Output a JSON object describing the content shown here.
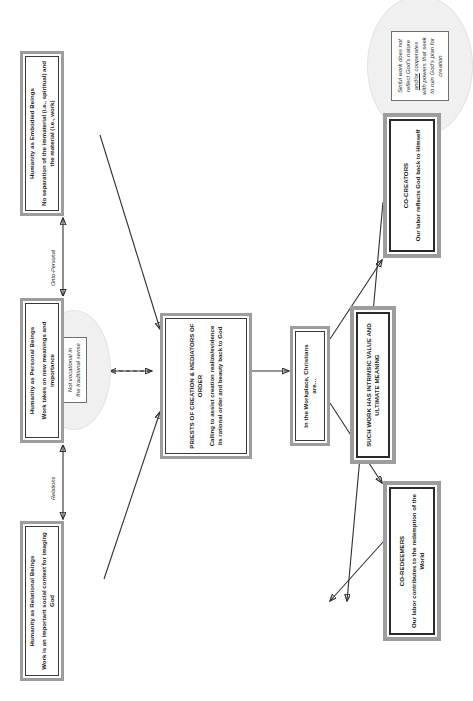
{
  "diagram": {
    "orientation": "rotated-90",
    "colors": {
      "node_outer_border": "#9d9d9d",
      "node_inner_border": "#3a3a3a",
      "callout_fill": "#f0f0f0",
      "edge": "#2f2f2f",
      "background": "#ffffff"
    }
  },
  "nodes": {
    "relational": {
      "title": "Humanity as Relational Beings",
      "body": "Work is an important social context for imaging God"
    },
    "personal": {
      "title": "Humanity as Personal Beings",
      "body": "Work takes on new meanings and importance"
    },
    "embodied": {
      "title": "Humanity as Embodied Beings",
      "body": "No separation of the immaterial (i.e., spiritual) and the material (i.e., work)"
    },
    "priests": {
      "title": "PRIESTS OF CREATION & MEDIATORS OF ORDER",
      "body": "Calling to assist creation realize/evidence its rational order and beauty back to God"
    },
    "workplace": {
      "title": "In the Workplace, Christians are…",
      "body": ""
    },
    "coredeemers": {
      "title": "CO-REDEEMERS",
      "body": "Our labor contributes to the redemption of the World"
    },
    "cocreators": {
      "title": "CO-CREATORS",
      "body": "Our labor reflects God back to Himself"
    },
    "conclusion": {
      "title": "SUCH WORK HAS INTRINSIC VALUE AND ULTIMATE MEANING",
      "body": ""
    }
  },
  "callouts": {
    "top": {
      "line1": "Not vocational in",
      "line2": "the traditional sense"
    },
    "bottom": {
      "line1": "Sinful work does not",
      "line2": "reflect God's nature",
      "line3_underline": "and/or",
      "line3_rest": " cooperates",
      "line4": "with powers that seek",
      "line5": "to ruin God's plan for",
      "line6": "creation"
    }
  },
  "edge_labels": {
    "relations": "Relations",
    "onto_personal": "Onto-Personal"
  }
}
